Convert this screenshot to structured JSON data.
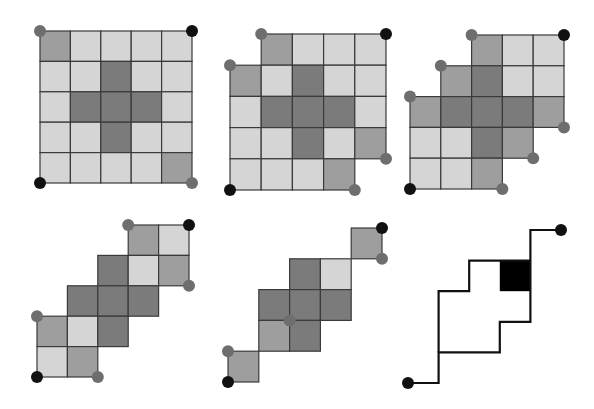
{
  "colors": {
    "light": "#d5d5d5",
    "mid": "#9e9e9e",
    "dark": "#7b7b7b",
    "line": "#3a3a3a",
    "dot_black": "#111111",
    "dot_gray": "#6e6e6e",
    "path": "#111111",
    "fill_black": "#000000"
  },
  "panels": [
    {
      "id": "panel-1",
      "origin": [
        40,
        31
      ],
      "cell": 30.4,
      "cells": [
        [
          0,
          0,
          "mid"
        ],
        [
          0,
          1,
          "light"
        ],
        [
          0,
          2,
          "light"
        ],
        [
          0,
          3,
          "light"
        ],
        [
          0,
          4,
          "light"
        ],
        [
          1,
          0,
          "light"
        ],
        [
          1,
          1,
          "light"
        ],
        [
          1,
          2,
          "dark"
        ],
        [
          1,
          3,
          "light"
        ],
        [
          1,
          4,
          "light"
        ],
        [
          2,
          0,
          "light"
        ],
        [
          2,
          1,
          "dark"
        ],
        [
          2,
          2,
          "dark"
        ],
        [
          2,
          3,
          "dark"
        ],
        [
          2,
          4,
          "light"
        ],
        [
          3,
          0,
          "light"
        ],
        [
          3,
          1,
          "light"
        ],
        [
          3,
          2,
          "dark"
        ],
        [
          3,
          3,
          "light"
        ],
        [
          3,
          4,
          "light"
        ],
        [
          4,
          0,
          "light"
        ],
        [
          4,
          1,
          "light"
        ],
        [
          4,
          2,
          "light"
        ],
        [
          4,
          3,
          "light"
        ],
        [
          4,
          4,
          "mid"
        ]
      ],
      "dots": [
        [
          0,
          0,
          "gray"
        ],
        [
          5,
          0,
          "black"
        ],
        [
          0,
          5,
          "black"
        ],
        [
          5,
          5,
          "gray"
        ]
      ]
    },
    {
      "id": "panel-2",
      "origin": [
        230,
        34
      ],
      "cell": 31.2,
      "cells": [
        [
          0,
          1,
          "mid"
        ],
        [
          0,
          2,
          "light"
        ],
        [
          0,
          3,
          "light"
        ],
        [
          0,
          4,
          "light"
        ],
        [
          1,
          0,
          "mid"
        ],
        [
          1,
          1,
          "light"
        ],
        [
          1,
          2,
          "dark"
        ],
        [
          1,
          3,
          "light"
        ],
        [
          1,
          4,
          "light"
        ],
        [
          2,
          0,
          "light"
        ],
        [
          2,
          1,
          "dark"
        ],
        [
          2,
          2,
          "dark"
        ],
        [
          2,
          3,
          "dark"
        ],
        [
          2,
          4,
          "light"
        ],
        [
          3,
          0,
          "light"
        ],
        [
          3,
          1,
          "light"
        ],
        [
          3,
          2,
          "dark"
        ],
        [
          3,
          3,
          "light"
        ],
        [
          3,
          4,
          "mid"
        ],
        [
          4,
          0,
          "light"
        ],
        [
          4,
          1,
          "light"
        ],
        [
          4,
          2,
          "light"
        ],
        [
          4,
          3,
          "mid"
        ]
      ],
      "dots": [
        [
          1,
          0,
          "gray"
        ],
        [
          5,
          0,
          "black"
        ],
        [
          0,
          1,
          "gray"
        ],
        [
          5,
          4,
          "gray"
        ],
        [
          4,
          5,
          "gray"
        ],
        [
          0,
          5,
          "black"
        ]
      ]
    },
    {
      "id": "panel-3",
      "origin": [
        410,
        35
      ],
      "cell": 30.8,
      "cells": [
        [
          0,
          2,
          "mid"
        ],
        [
          0,
          3,
          "light"
        ],
        [
          0,
          4,
          "light"
        ],
        [
          1,
          1,
          "mid"
        ],
        [
          1,
          2,
          "dark"
        ],
        [
          1,
          3,
          "light"
        ],
        [
          1,
          4,
          "light"
        ],
        [
          2,
          0,
          "mid"
        ],
        [
          2,
          1,
          "dark"
        ],
        [
          2,
          2,
          "dark"
        ],
        [
          2,
          3,
          "dark"
        ],
        [
          2,
          4,
          "mid"
        ],
        [
          3,
          0,
          "light"
        ],
        [
          3,
          1,
          "light"
        ],
        [
          3,
          2,
          "dark"
        ],
        [
          3,
          3,
          "mid"
        ],
        [
          4,
          0,
          "light"
        ],
        [
          4,
          1,
          "light"
        ],
        [
          4,
          2,
          "mid"
        ]
      ],
      "dots": [
        [
          2,
          0,
          "gray"
        ],
        [
          5,
          0,
          "black"
        ],
        [
          1,
          1,
          "gray"
        ],
        [
          0,
          2,
          "gray"
        ],
        [
          5,
          3,
          "gray"
        ],
        [
          4,
          4,
          "gray"
        ],
        [
          3,
          5,
          "gray"
        ],
        [
          0,
          5,
          "black"
        ]
      ]
    },
    {
      "id": "panel-4",
      "origin": [
        37,
        225
      ],
      "cell": 30.4,
      "cells": [
        [
          0,
          3,
          "mid"
        ],
        [
          0,
          4,
          "light"
        ],
        [
          1,
          2,
          "dark"
        ],
        [
          1,
          3,
          "light"
        ],
        [
          1,
          4,
          "mid"
        ],
        [
          2,
          1,
          "dark"
        ],
        [
          2,
          2,
          "dark"
        ],
        [
          2,
          3,
          "dark"
        ],
        [
          3,
          0,
          "mid"
        ],
        [
          3,
          1,
          "light"
        ],
        [
          3,
          2,
          "dark"
        ],
        [
          4,
          0,
          "light"
        ],
        [
          4,
          1,
          "mid"
        ]
      ],
      "dots": [
        [
          3,
          0,
          "gray"
        ],
        [
          5,
          0,
          "black"
        ],
        [
          5,
          2,
          "gray"
        ],
        [
          0,
          3,
          "gray"
        ],
        [
          0,
          5,
          "black"
        ],
        [
          2,
          5,
          "gray"
        ]
      ]
    },
    {
      "id": "panel-5",
      "origin": [
        228,
        228
      ],
      "cell": 30.8,
      "cells": [
        [
          0,
          4,
          "mid"
        ],
        [
          1,
          2,
          "dark"
        ],
        [
          1,
          3,
          "light"
        ],
        [
          2,
          1,
          "dark"
        ],
        [
          2,
          2,
          "dark"
        ],
        [
          2,
          3,
          "dark"
        ],
        [
          3,
          1,
          "mid"
        ],
        [
          3,
          2,
          "dark"
        ],
        [
          4,
          0,
          "mid"
        ]
      ],
      "dots": [
        [
          5,
          0,
          "black"
        ],
        [
          5,
          1,
          "gray"
        ],
        [
          2,
          3,
          "gray"
        ],
        [
          0,
          4,
          "gray"
        ],
        [
          0,
          5,
          "black"
        ]
      ]
    },
    {
      "id": "panel-6",
      "origin": [
        408,
        230
      ],
      "cell": 30.6,
      "cells": [],
      "black_cells": [
        [
          1,
          3
        ]
      ],
      "paths": [
        [
          [
            0,
            5
          ],
          [
            1,
            5
          ],
          [
            1,
            4
          ],
          [
            3,
            4
          ],
          [
            3,
            3
          ],
          [
            4,
            3
          ],
          [
            4,
            0
          ],
          [
            5,
            0
          ]
        ],
        [
          [
            1,
            4
          ],
          [
            1,
            2
          ],
          [
            2,
            2
          ],
          [
            2,
            1
          ],
          [
            4,
            1
          ]
        ]
      ],
      "dots": [
        [
          0,
          5,
          "black"
        ],
        [
          5,
          0,
          "black"
        ]
      ]
    }
  ]
}
